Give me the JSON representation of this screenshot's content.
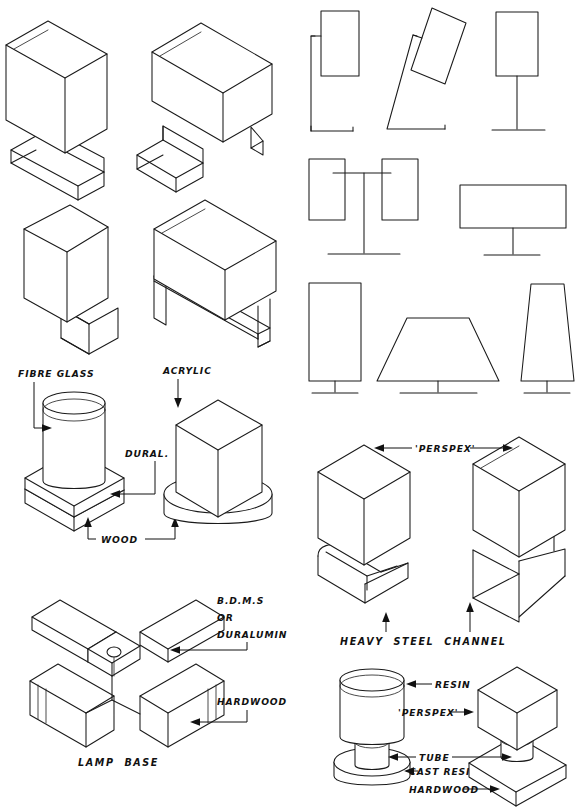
{
  "sheet": {
    "title": "Lamp and light fitting construction drawing sheet",
    "background": "#ffffff",
    "ink": "#1a1a1a",
    "width": 581,
    "height": 812
  },
  "labels": {
    "fibre_glass": "FIBRE GLASS",
    "acrylic": "ACRYLIC",
    "dural": "DURAL.",
    "wood": "WOOD",
    "bdms": "B.D.M.S",
    "or": "OR",
    "duralumin": "DURALUMIN",
    "hardwood": "HARDWOOD",
    "lamp_base": "LAMP  BASE",
    "perspex": "'PERSPEX'",
    "heavy_steel_channel": "HEAVY  STEEL  CHANNEL",
    "resin": "RESIN",
    "perspex2": "'PERSPEX'",
    "tube": "TUBE",
    "cast_resin": "CAST RESIN",
    "hardwood2": "HARDWOOD"
  },
  "figures": [
    {
      "id": "iso-box-tall-left",
      "name": "open-top rectangular shade on folded channel base",
      "row": 1,
      "column": "left"
    },
    {
      "id": "iso-box-wide-right",
      "name": "open-top wide box on folded channel base",
      "row": 1,
      "column": "left"
    },
    {
      "id": "iso-prism-triangular",
      "name": "triangular prism shade on channel foot",
      "row": 2,
      "column": "left"
    },
    {
      "id": "iso-box-long",
      "name": "long open-top box on flat channel legs",
      "row": 2,
      "column": "left"
    },
    {
      "id": "iso-cylinder-on-square-base",
      "name": "fibre glass cylinder on dural and wood square base",
      "row": 3,
      "column": "left"
    },
    {
      "id": "iso-square-on-round-base",
      "name": "acrylic square column on round wood base",
      "row": 3,
      "column": "left"
    },
    {
      "id": "iso-cross-lamp-base",
      "name": "cruciform lamp base of metal and hardwood",
      "row": 4,
      "column": "left"
    },
    {
      "id": "elev-bracket-shade",
      "name": "shade on side bracket elevation",
      "row": 1,
      "column": "right"
    },
    {
      "id": "elev-tilted-shade",
      "name": "tilted shade on raking stem elevation",
      "row": 1,
      "column": "right"
    },
    {
      "id": "elev-post-shade",
      "name": "shade on centre post elevation",
      "row": 1,
      "column": "right"
    },
    {
      "id": "elev-twin-shades",
      "name": "twin shades on crossbar elevation",
      "row": 2,
      "column": "right"
    },
    {
      "id": "elev-wide-shade",
      "name": "wide shade on short post elevation",
      "row": 2,
      "column": "right"
    },
    {
      "id": "elev-tall-rect-shade",
      "name": "tall rectangular shade silhouette",
      "row": 3,
      "column": "right"
    },
    {
      "id": "elev-trapezoid-shade",
      "name": "flared trapezoid shade silhouette",
      "row": 3,
      "column": "right"
    },
    {
      "id": "elev-tapered-shade",
      "name": "narrow tapered shade silhouette",
      "row": 3,
      "column": "right"
    },
    {
      "id": "iso-perspex-channel-left",
      "name": "perspex box on heavy steel channel",
      "row": 4,
      "column": "right"
    },
    {
      "id": "iso-perspex-channel-right",
      "name": "perspex box on heavy steel channel variant",
      "row": 4,
      "column": "right"
    },
    {
      "id": "iso-resin-cylinder",
      "name": "resin cylinder on cast resin base with tube",
      "row": 5,
      "column": "right"
    },
    {
      "id": "iso-perspex-cube",
      "name": "perspex cube on hardwood base with tube",
      "row": 5,
      "column": "right"
    }
  ]
}
